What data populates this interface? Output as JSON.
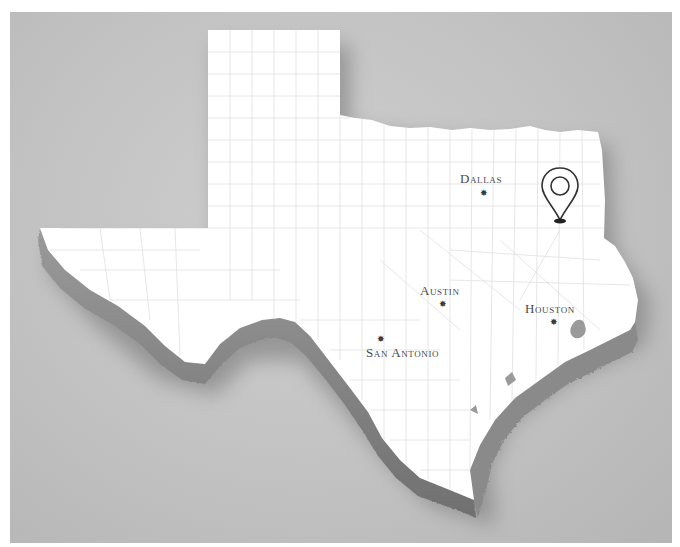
{
  "map": {
    "region": "Texas",
    "style": "3D extruded white state map with county lines on gray background",
    "colors": {
      "background": "#c4c4c4",
      "land": "#ffffff",
      "extrusion": "#8c8c8c",
      "county_lines": "#dcdcdc",
      "label_text": "#4a4a4a",
      "marker": "#333333"
    }
  },
  "cities": [
    {
      "name": "Dallas",
      "label": "Dallas",
      "icon": "star-icon",
      "x": 484,
      "y": 193,
      "label_x": 460,
      "label_y": 172
    },
    {
      "name": "Austin",
      "label": "Austin",
      "icon": "star-icon",
      "x": 443,
      "y": 304,
      "label_x": 420,
      "label_y": 284
    },
    {
      "name": "Houston",
      "label": "Houston",
      "icon": "star-icon",
      "x": 554,
      "y": 322,
      "label_x": 525,
      "label_y": 302
    },
    {
      "name": "San Antonio",
      "label": "San Antonio",
      "icon": "star-icon",
      "x": 381,
      "y": 340,
      "label_x": 366,
      "label_y": 346
    }
  ],
  "pin": {
    "icon": "map-pin-icon",
    "x": 548,
    "y": 185
  }
}
